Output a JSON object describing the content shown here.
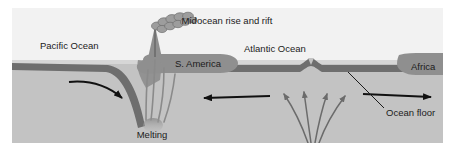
{
  "figure": {
    "kind": "geology-cross-section",
    "title_label": "Midocean rise and rift",
    "canvas": {
      "width": 456,
      "height": 151,
      "margin_left": 12,
      "margin_top": 8
    }
  },
  "labels": {
    "midocean_rise": "Midocean rise and rift",
    "pacific_ocean": "Pacific Ocean",
    "atlantic_ocean": "Atlantic Ocean",
    "s_america": "S. America",
    "africa": "Africa",
    "ocean_floor": "Ocean floor",
    "melting": "Melting"
  },
  "colors": {
    "background": "#ffffff",
    "sky": "#f2f2f2",
    "water": "#d9d9d9",
    "mantle": "#c3c3c3",
    "crust": "#6e6e6e",
    "continent": "#8f8f8f",
    "plume": "#9a9a9a",
    "arrow": "#111111",
    "convection_arrow": "#6b6b6b",
    "magma": "#8a8a8a",
    "text": "#1b1b1b"
  },
  "features": {
    "sea_level_y": 52,
    "crust_top_y": 55,
    "crust_thickness": 7,
    "subduction_x": 120,
    "ridge_x": 300,
    "continent_s_america": {
      "x": 135,
      "width": 90
    },
    "continent_africa": {
      "x": 372,
      "width": 59
    }
  },
  "arrows": [
    {
      "name": "pacific-plate-arrow",
      "direction": "right-down",
      "label": ""
    },
    {
      "name": "s-america-westward-arrow",
      "direction": "left",
      "label": ""
    },
    {
      "name": "africa-eastward-arrow",
      "direction": "right",
      "label": ""
    }
  ],
  "convection_arrows": {
    "name": "mantle-convection-arrows",
    "count": 4,
    "direction": "upward-fanning"
  }
}
